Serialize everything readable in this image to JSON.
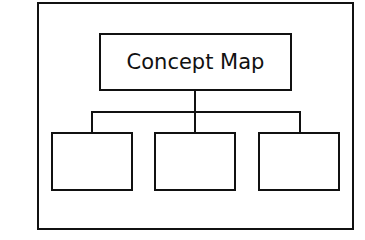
{
  "diagram": {
    "type": "concept-map-template",
    "root": {
      "label": "Concept Map"
    },
    "children": [
      {
        "label": ""
      },
      {
        "label": ""
      },
      {
        "label": ""
      }
    ],
    "colors": {
      "stroke": "#111111",
      "background": "#ffffff"
    }
  }
}
